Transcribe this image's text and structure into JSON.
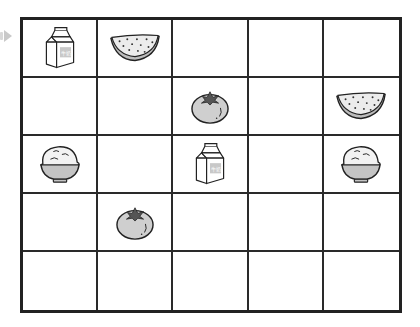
{
  "puzzle": {
    "rows": 5,
    "cols": 5,
    "start_marker": "play-arrow-icon",
    "cells": [
      [
        "milk",
        "watermelon",
        "",
        "",
        ""
      ],
      [
        "",
        "",
        "tomato",
        "",
        "watermelon"
      ],
      [
        "rice",
        "",
        "milk",
        "",
        "rice"
      ],
      [
        "",
        "tomato",
        "",
        "",
        ""
      ],
      [
        "",
        "",
        "",
        "",
        ""
      ]
    ],
    "milk_label": "牛奶"
  },
  "colors": {
    "grid_line": "#222222",
    "icon_fill_gray": "#d0d0d0",
    "arrow": "#c9c9c9"
  }
}
